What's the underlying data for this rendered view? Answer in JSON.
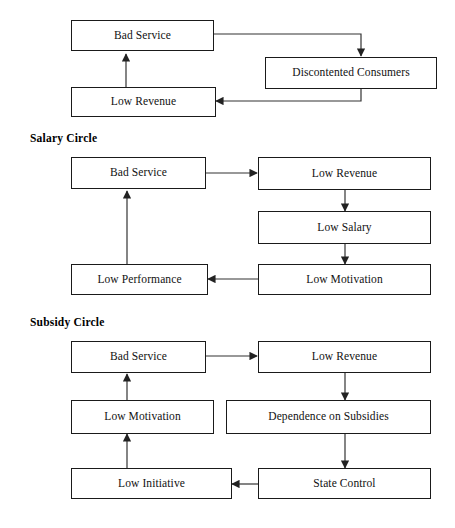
{
  "figure": {
    "caption": "",
    "line_color": "#333333",
    "box_border_color": "#1a1a1a",
    "background": "#ffffff"
  },
  "diagrams": [
    {
      "id": "consumer-circle",
      "title": "",
      "nodes": [
        {
          "id": "d1-bad-service",
          "label": "Bad Service"
        },
        {
          "id": "d1-discontented-consumers",
          "label": "Discontented Consumers"
        },
        {
          "id": "d1-low-revenue",
          "label": "Low Revenue"
        }
      ],
      "edges": [
        {
          "from": "Bad Service",
          "to": "Discontented Consumers"
        },
        {
          "from": "Discontented Consumers",
          "to": "Low Revenue"
        },
        {
          "from": "Low Revenue",
          "to": "Bad Service"
        }
      ]
    },
    {
      "id": "salary-circle",
      "title": "Salary Circle",
      "nodes": [
        {
          "id": "d2-bad-service",
          "label": "Bad Service"
        },
        {
          "id": "d2-low-revenue",
          "label": "Low Revenue"
        },
        {
          "id": "d2-low-salary",
          "label": "Low Salary"
        },
        {
          "id": "d2-low-motivation",
          "label": "Low Motivation"
        },
        {
          "id": "d2-low-performance",
          "label": "Low Performance"
        }
      ],
      "edges": [
        {
          "from": "Bad Service",
          "to": "Low Revenue"
        },
        {
          "from": "Low Revenue",
          "to": "Low Salary"
        },
        {
          "from": "Low Salary",
          "to": "Low Motivation"
        },
        {
          "from": "Low Motivation",
          "to": "Low Performance"
        },
        {
          "from": "Low Performance",
          "to": "Bad Service"
        }
      ]
    },
    {
      "id": "subsidy-circle",
      "title": "Subsidy Circle",
      "nodes": [
        {
          "id": "d3-bad-service",
          "label": "Bad Service"
        },
        {
          "id": "d3-low-revenue",
          "label": "Low Revenue"
        },
        {
          "id": "d3-dependence-on-subsidies",
          "label": "Dependence on Subsidies"
        },
        {
          "id": "d3-state-control",
          "label": "State Control"
        },
        {
          "id": "d3-low-initiative",
          "label": "Low Initiative"
        },
        {
          "id": "d3-low-motivation",
          "label": "Low Motivation"
        }
      ],
      "edges": [
        {
          "from": "Bad Service",
          "to": "Low Revenue"
        },
        {
          "from": "Low Revenue",
          "to": "Dependence on Subsidies"
        },
        {
          "from": "Dependence on Subsidies",
          "to": "State Control"
        },
        {
          "from": "State Control",
          "to": "Low Initiative"
        },
        {
          "from": "Low Initiative",
          "to": "Low Motivation"
        },
        {
          "from": "Low Motivation",
          "to": "Bad Service"
        }
      ]
    }
  ]
}
